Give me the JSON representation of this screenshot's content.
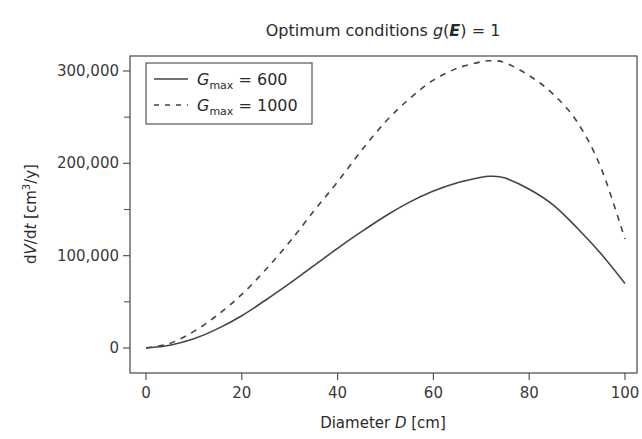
{
  "chart_data": {
    "type": "line",
    "title": "Optimum conditions g(E) = 1",
    "title_parts": {
      "prefix": "Optimum conditions ",
      "func": "g",
      "arg": "E",
      "suffix": " = 1"
    },
    "xlabel": "Diameter D [cm]",
    "xlabel_parts": {
      "prefix": "Diameter ",
      "var": "D",
      "suffix": " [cm]"
    },
    "ylabel": "dV/dt [cm³/y]",
    "ylabel_parts": {
      "a": "d",
      "b": "V",
      "c": "/d",
      "d": "t",
      "e": " [cm",
      "sup": "3",
      "f": "/y]"
    },
    "xlim": [
      0,
      100
    ],
    "ylim": [
      0,
      300000
    ],
    "x_ticks": [
      0,
      20,
      40,
      60,
      80,
      100
    ],
    "x_tick_labels": [
      "0",
      "20",
      "40",
      "60",
      "80",
      "100"
    ],
    "y_ticks": [
      0,
      100000,
      200000,
      300000
    ],
    "y_tick_labels": [
      "0",
      "100,000",
      "200,000",
      "300,000"
    ],
    "y_minor_ticks": [
      50000,
      150000,
      250000
    ],
    "grid": false,
    "legend_position": "upper left",
    "x": [
      0,
      5,
      10,
      15,
      20,
      25,
      30,
      35,
      40,
      45,
      50,
      55,
      60,
      65,
      70,
      72,
      75,
      80,
      85,
      90,
      95,
      100
    ],
    "series": [
      {
        "name": "G_max = 600",
        "label_main": "G",
        "label_sub": "max",
        "label_value": " = 600",
        "style": "solid",
        "values": [
          0,
          3000,
          10000,
          21000,
          35000,
          52000,
          70000,
          89000,
          108000,
          126000,
          143000,
          158000,
          170000,
          179000,
          185000,
          186000,
          184000,
          172000,
          155000,
          130000,
          102000,
          70000
        ]
      },
      {
        "name": "G_max = 1000",
        "label_main": "G",
        "label_sub": "max",
        "label_value": " = 1000",
        "style": "dashed",
        "values": [
          0,
          5000,
          18000,
          36000,
          58000,
          85000,
          115000,
          148000,
          180000,
          214000,
          245000,
          270000,
          290000,
          303000,
          310000,
          311000,
          309000,
          295000,
          275000,
          245000,
          195000,
          118000
        ]
      }
    ]
  }
}
